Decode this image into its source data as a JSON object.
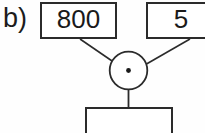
{
  "figure": {
    "part_label": "b)",
    "background_color": "#fefefe",
    "stroke_color": "#2b2b2b",
    "text_color": "#1a1a1a"
  },
  "diagram": {
    "type": "arithmetic-operation-flow",
    "operator_symbol": "·",
    "operator_name": "multiplication-dot",
    "operands": [
      {
        "id": "operand-left",
        "value": "800",
        "clipped": false
      },
      {
        "id": "operand-right",
        "value": "5",
        "clipped": true
      }
    ],
    "result": {
      "id": "result-box",
      "value": "",
      "clipped": true
    }
  }
}
